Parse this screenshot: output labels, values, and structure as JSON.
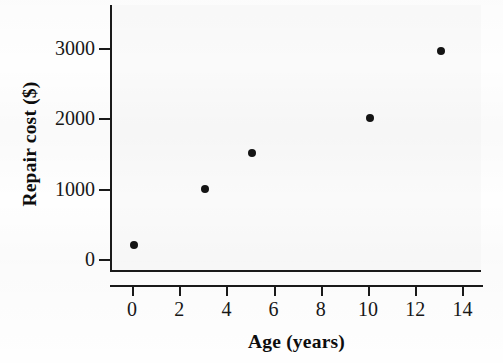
{
  "chart_data": {
    "type": "scatter",
    "title": "",
    "xlabel": "Age (years)",
    "ylabel": "Repair cost ($)",
    "xlim": [
      -1,
      15
    ],
    "ylim": [
      -200,
      3400
    ],
    "xticks": [
      "0",
      "2",
      "4",
      "6",
      "8",
      "10",
      "12",
      "14"
    ],
    "xtick_values": [
      0,
      2,
      4,
      6,
      8,
      10,
      12,
      14
    ],
    "yticks": [
      "0",
      "1000",
      "2000",
      "3000"
    ],
    "ytick_values": [
      0,
      1000,
      2000,
      3000
    ],
    "grid": false,
    "legend": false,
    "marker": "filled-circle",
    "marker_color": "#141414",
    "points": [
      {
        "x": 0,
        "y": 200
      },
      {
        "x": 3,
        "y": 1000
      },
      {
        "x": 5,
        "y": 1500
      },
      {
        "x": 10,
        "y": 2000
      },
      {
        "x": 13,
        "y": 2950
      }
    ],
    "series": [
      {
        "name": "Repair cost vs age",
        "x": [
          0,
          3,
          5,
          10,
          13
        ],
        "values": [
          200,
          1000,
          1500,
          2000,
          2950
        ]
      }
    ]
  },
  "colors": {
    "axis": "#1a1a1a",
    "text": "#171717",
    "title_text": "#0d0d0d",
    "plot_background": "#fafafa",
    "figure_background": "#fefefe",
    "marker": "#141414"
  }
}
